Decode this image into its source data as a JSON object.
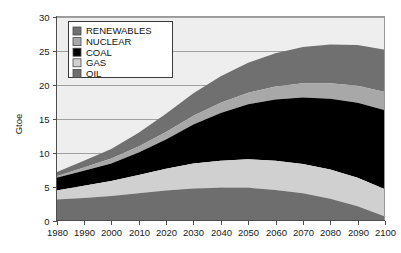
{
  "chart_data": {
    "type": "area",
    "stacked": true,
    "title": "",
    "xlabel": "",
    "ylabel": "Gtoe",
    "xlim": [
      1980,
      2100
    ],
    "ylim": [
      0,
      30
    ],
    "xticks": [
      1980,
      1990,
      2000,
      2010,
      2020,
      2030,
      2040,
      2050,
      2060,
      2070,
      2080,
      2090,
      2100
    ],
    "yticks": [
      0,
      5,
      10,
      15,
      20,
      25,
      30
    ],
    "grid": "horizontal",
    "legend_position": "top-left-inside",
    "x": [
      1980,
      1990,
      2000,
      2010,
      2020,
      2030,
      2040,
      2050,
      2060,
      2070,
      2080,
      2090,
      2100
    ],
    "series": [
      {
        "name": "OIL",
        "color": "#6e6e6e",
        "stack_order": 1,
        "values": [
          3.1,
          3.3,
          3.6,
          4.0,
          4.4,
          4.7,
          4.8,
          4.8,
          4.5,
          4.0,
          3.2,
          2.1,
          0.6
        ]
      },
      {
        "name": "GAS",
        "color": "#d0d0d0",
        "stack_order": 2,
        "values": [
          1.3,
          1.8,
          2.2,
          2.7,
          3.2,
          3.7,
          4.0,
          4.2,
          4.3,
          4.3,
          4.3,
          4.2,
          4.0
        ]
      },
      {
        "name": "COAL",
        "color": "#000000",
        "stack_order": 3,
        "values": [
          1.9,
          2.2,
          2.6,
          3.3,
          4.3,
          5.7,
          7.0,
          8.1,
          9.0,
          9.8,
          10.4,
          11.0,
          11.6
        ]
      },
      {
        "name": "NUCLEAR",
        "color": "#a8a8a8",
        "stack_order": 4,
        "values": [
          0.2,
          0.5,
          0.7,
          0.9,
          1.1,
          1.3,
          1.5,
          1.7,
          1.9,
          2.1,
          2.3,
          2.5,
          2.7
        ]
      },
      {
        "name": "RENEWABLES",
        "color": "#707070",
        "stack_order": 5,
        "values": [
          0.6,
          1.0,
          1.4,
          2.0,
          2.7,
          3.3,
          3.9,
          4.4,
          4.9,
          5.3,
          5.7,
          6.0,
          6.2
        ]
      }
    ],
    "stack_totals": [
      7.1,
      8.8,
      10.5,
      12.9,
      15.7,
      18.7,
      21.2,
      23.2,
      24.6,
      25.5,
      25.9,
      25.8,
      25.1
    ]
  },
  "axes": {
    "y_axis_title": "Gtoe",
    "y_tick_labels": [
      "30",
      "25",
      "20",
      "15",
      "10",
      "5",
      "0"
    ],
    "x_tick_labels": [
      "1980",
      "1990",
      "2000",
      "2010",
      "2020",
      "2030",
      "2040",
      "2050",
      "2060",
      "2070",
      "2080",
      "2090",
      "2100"
    ]
  },
  "legend": {
    "items": [
      {
        "label": "RENEWABLES",
        "color": "#707070"
      },
      {
        "label": "NUCLEAR",
        "color": "#a8a8a8"
      },
      {
        "label": "COAL",
        "color": "#000000"
      },
      {
        "label": "GAS",
        "color": "#d0d0d0"
      },
      {
        "label": "OIL",
        "color": "#6e6e6e"
      }
    ]
  },
  "colors": {
    "plot_background": "#eeeeee",
    "frame": "#9a9a9a",
    "gridline": "#8c8c8c",
    "axis": "#4d4d4d",
    "text": "#1a1a1a"
  }
}
